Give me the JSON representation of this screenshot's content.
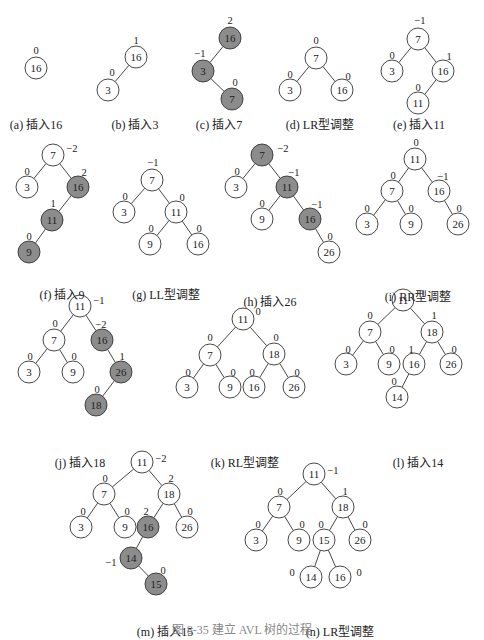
{
  "colors": {
    "highlight_fill": "#8c8c8c",
    "node_fill": "#ffffff",
    "stroke": "#333333",
    "text": "#222222"
  },
  "figure_caption": "图 8-35  建立 AVL 树的过程",
  "panels": [
    {
      "id": "a",
      "caption": "(a) 插入16",
      "cx": 36,
      "cy": 100,
      "nodes": [
        {
          "id": "n16",
          "label": "16",
          "x": 36,
          "y": 68,
          "bf": "0",
          "bfx": 36,
          "bfy": 50,
          "hl": false
        }
      ],
      "edges": []
    },
    {
      "id": "b",
      "caption": "(b) 插入3",
      "cx": 135,
      "cy": 100,
      "nodes": [
        {
          "id": "n16",
          "label": "16",
          "x": 136,
          "y": 57,
          "bf": "1",
          "bfx": 136,
          "bfy": 40,
          "hl": false
        },
        {
          "id": "n3",
          "label": "3",
          "x": 108,
          "y": 90,
          "bf": "0",
          "bfx": 112,
          "bfy": 72,
          "hl": false
        }
      ],
      "edges": [
        [
          "n16",
          "n3"
        ]
      ]
    },
    {
      "id": "c",
      "caption": "(c) 插入7",
      "cx": 219,
      "cy": 100,
      "nodes": [
        {
          "id": "n16",
          "label": "16",
          "x": 230,
          "y": 38,
          "bf": "2",
          "bfx": 230,
          "bfy": 20,
          "hl": true
        },
        {
          "id": "n3",
          "label": "3",
          "x": 203,
          "y": 71,
          "bf": "-1",
          "bfx": 200,
          "bfy": 53,
          "hl": true
        },
        {
          "id": "n7",
          "label": "7",
          "x": 232,
          "y": 99,
          "bf": "0",
          "bfx": 235,
          "bfy": 82,
          "hl": true
        }
      ],
      "edges": [
        [
          "n16",
          "n3"
        ],
        [
          "n3",
          "n7"
        ]
      ]
    },
    {
      "id": "d",
      "caption": "(d) LR型调整",
      "cx": 320,
      "cy": 100,
      "nodes": [
        {
          "id": "n7",
          "label": "7",
          "x": 316,
          "y": 58,
          "bf": "0",
          "bfx": 316,
          "bfy": 40,
          "hl": false
        },
        {
          "id": "n3",
          "label": "3",
          "x": 290,
          "y": 90,
          "bf": "0",
          "bfx": 290,
          "bfy": 74,
          "hl": false
        },
        {
          "id": "n16",
          "label": "16",
          "x": 342,
          "y": 90,
          "bf": "0",
          "bfx": 348,
          "bfy": 76,
          "hl": false
        }
      ],
      "edges": [
        [
          "n7",
          "n3"
        ],
        [
          "n7",
          "n16"
        ]
      ]
    },
    {
      "id": "e",
      "caption": "(e) 插入11",
      "cx": 419,
      "cy": 100,
      "nodes": [
        {
          "id": "n7",
          "label": "7",
          "x": 418,
          "y": 39,
          "bf": "-1",
          "bfx": 420,
          "bfy": 20,
          "hl": false
        },
        {
          "id": "n3",
          "label": "3",
          "x": 392,
          "y": 71,
          "bf": "0",
          "bfx": 392,
          "bfy": 55,
          "hl": false
        },
        {
          "id": "n16",
          "label": "16",
          "x": 443,
          "y": 71,
          "bf": "1",
          "bfx": 449,
          "bfy": 56,
          "hl": false
        },
        {
          "id": "n11",
          "label": "11",
          "x": 418,
          "y": 103,
          "bf": "0",
          "bfx": 418,
          "bfy": 87,
          "hl": false
        }
      ],
      "edges": [
        [
          "n7",
          "n3"
        ],
        [
          "n7",
          "n16"
        ],
        [
          "n16",
          "n11"
        ]
      ]
    },
    {
      "id": "f",
      "caption": "(f) 插入9",
      "cx": 62,
      "cy": 270,
      "nodes": [
        {
          "id": "n7",
          "label": "7",
          "x": 53,
          "y": 155,
          "bf": "-2",
          "bfx": 72,
          "bfy": 148,
          "hl": false
        },
        {
          "id": "n3",
          "label": "3",
          "x": 27,
          "y": 187,
          "bf": "0",
          "bfx": 27,
          "bfy": 171,
          "hl": false
        },
        {
          "id": "n16",
          "label": "16",
          "x": 78,
          "y": 187,
          "bf": "2",
          "bfx": 84,
          "bfy": 172,
          "hl": true
        },
        {
          "id": "n11",
          "label": "11",
          "x": 52,
          "y": 220,
          "bf": "1",
          "bfx": 53,
          "bfy": 203,
          "hl": true
        },
        {
          "id": "n9",
          "label": "9",
          "x": 29,
          "y": 252,
          "bf": "0",
          "bfx": 29,
          "bfy": 236,
          "hl": true
        }
      ],
      "edges": [
        [
          "n7",
          "n3"
        ],
        [
          "n7",
          "n16"
        ],
        [
          "n16",
          "n11"
        ],
        [
          "n11",
          "n9"
        ]
      ]
    },
    {
      "id": "g",
      "caption": "(g) LL型调整",
      "cx": 166,
      "cy": 270,
      "nodes": [
        {
          "id": "n7",
          "label": "7",
          "x": 152,
          "y": 180,
          "bf": "-1",
          "bfx": 153,
          "bfy": 162,
          "hl": false
        },
        {
          "id": "n3",
          "label": "3",
          "x": 124,
          "y": 212,
          "bf": "0",
          "bfx": 125,
          "bfy": 196,
          "hl": false
        },
        {
          "id": "n11",
          "label": "11",
          "x": 176,
          "y": 212,
          "bf": "0",
          "bfx": 182,
          "bfy": 197,
          "hl": false
        },
        {
          "id": "n9",
          "label": "9",
          "x": 150,
          "y": 244,
          "bf": "0",
          "bfx": 151,
          "bfy": 228,
          "hl": false
        },
        {
          "id": "n16",
          "label": "16",
          "x": 198,
          "y": 244,
          "bf": "0",
          "bfx": 199,
          "bfy": 228,
          "hl": false
        }
      ],
      "edges": [
        [
          "n7",
          "n3"
        ],
        [
          "n7",
          "n11"
        ],
        [
          "n11",
          "n9"
        ],
        [
          "n11",
          "n16"
        ]
      ]
    },
    {
      "id": "h",
      "caption": "(h) 插入26",
      "cx": 270,
      "cy": 277,
      "nodes": [
        {
          "id": "n7",
          "label": "7",
          "x": 262,
          "y": 155,
          "bf": "-2",
          "bfx": 283,
          "bfy": 148,
          "hl": true
        },
        {
          "id": "n3",
          "label": "3",
          "x": 236,
          "y": 187,
          "bf": "0",
          "bfx": 237,
          "bfy": 171,
          "hl": false
        },
        {
          "id": "n11",
          "label": "11",
          "x": 287,
          "y": 187,
          "bf": "-1",
          "bfx": 294,
          "bfy": 172,
          "hl": true
        },
        {
          "id": "n9",
          "label": "9",
          "x": 262,
          "y": 219,
          "bf": "0",
          "bfx": 262,
          "bfy": 203,
          "hl": false
        },
        {
          "id": "n16",
          "label": "16",
          "x": 310,
          "y": 219,
          "bf": "-1",
          "bfx": 317,
          "bfy": 204,
          "hl": true
        },
        {
          "id": "n26",
          "label": "26",
          "x": 329,
          "y": 252,
          "bf": "0",
          "bfx": 330,
          "bfy": 236,
          "hl": false
        }
      ],
      "edges": [
        [
          "n7",
          "n3"
        ],
        [
          "n7",
          "n11"
        ],
        [
          "n11",
          "n9"
        ],
        [
          "n11",
          "n16"
        ],
        [
          "n16",
          "n26"
        ]
      ]
    },
    {
      "id": "i",
      "caption": "(i) RR型调整",
      "cx": 418,
      "cy": 272,
      "nodes": [
        {
          "id": "n11",
          "label": "11",
          "x": 415,
          "y": 159,
          "bf": "0",
          "bfx": 416,
          "bfy": 142,
          "hl": false
        },
        {
          "id": "n7",
          "label": "7",
          "x": 392,
          "y": 191,
          "bf": "0",
          "bfx": 393,
          "bfy": 175,
          "hl": false
        },
        {
          "id": "n16",
          "label": "16",
          "x": 439,
          "y": 191,
          "bf": "-1",
          "bfx": 443,
          "bfy": 176,
          "hl": false
        },
        {
          "id": "n3",
          "label": "3",
          "x": 367,
          "y": 224,
          "bf": "0",
          "bfx": 367,
          "bfy": 208,
          "hl": false
        },
        {
          "id": "n9",
          "label": "9",
          "x": 411,
          "y": 224,
          "bf": "0",
          "bfx": 411,
          "bfy": 208,
          "hl": false
        },
        {
          "id": "n26",
          "label": "26",
          "x": 458,
          "y": 224,
          "bf": "0",
          "bfx": 459,
          "bfy": 208,
          "hl": false
        }
      ],
      "edges": [
        [
          "n11",
          "n7"
        ],
        [
          "n11",
          "n16"
        ],
        [
          "n7",
          "n3"
        ],
        [
          "n7",
          "n9"
        ],
        [
          "n16",
          "n26"
        ]
      ]
    },
    {
      "id": "j",
      "caption": "(j) 插入18",
      "cx": 80,
      "cy": 438,
      "nodes": [
        {
          "id": "n11",
          "label": "11",
          "x": 80,
          "y": 306,
          "bf": "-1",
          "bfx": 99,
          "bfy": 300,
          "hl": false
        },
        {
          "id": "n7",
          "label": "7",
          "x": 54,
          "y": 340,
          "bf": "0",
          "bfx": 55,
          "bfy": 323,
          "hl": false
        },
        {
          "id": "n16",
          "label": "16",
          "x": 102,
          "y": 340,
          "bf": "-2",
          "bfx": 101,
          "bfy": 324,
          "hl": true
        },
        {
          "id": "n3",
          "label": "3",
          "x": 29,
          "y": 372,
          "bf": "0",
          "bfx": 30,
          "bfy": 356,
          "hl": false
        },
        {
          "id": "n9",
          "label": "9",
          "x": 73,
          "y": 372,
          "bf": "0",
          "bfx": 74,
          "bfy": 356,
          "hl": false
        },
        {
          "id": "n26",
          "label": "26",
          "x": 121,
          "y": 372,
          "bf": "1",
          "bfx": 122,
          "bfy": 356,
          "hl": true
        },
        {
          "id": "n18",
          "label": "18",
          "x": 96,
          "y": 405,
          "bf": "0",
          "bfx": 97,
          "bfy": 389,
          "hl": true
        }
      ],
      "edges": [
        [
          "n11",
          "n7"
        ],
        [
          "n11",
          "n16"
        ],
        [
          "n7",
          "n3"
        ],
        [
          "n7",
          "n9"
        ],
        [
          "n16",
          "n26"
        ],
        [
          "n26",
          "n18"
        ]
      ]
    },
    {
      "id": "k",
      "caption": "(k) RL型调整",
      "cx": 245,
      "cy": 438,
      "nodes": [
        {
          "id": "n11",
          "label": "11",
          "x": 243,
          "y": 319,
          "bf": "0",
          "bfx": 258,
          "bfy": 311,
          "hl": false
        },
        {
          "id": "n7",
          "label": "7",
          "x": 210,
          "y": 355,
          "bf": "0",
          "bfx": 210,
          "bfy": 337,
          "hl": false
        },
        {
          "id": "n18",
          "label": "18",
          "x": 274,
          "y": 354,
          "bf": "0",
          "bfx": 276,
          "bfy": 337,
          "hl": false
        },
        {
          "id": "n3",
          "label": "3",
          "x": 187,
          "y": 387,
          "bf": "0",
          "bfx": 188,
          "bfy": 372,
          "hl": false
        },
        {
          "id": "n9",
          "label": "9",
          "x": 230,
          "y": 387,
          "bf": "0",
          "bfx": 233,
          "bfy": 372,
          "hl": false
        },
        {
          "id": "n16",
          "label": "16",
          "x": 254,
          "y": 387,
          "bf": "0",
          "bfx": 252,
          "bfy": 372,
          "hl": false
        },
        {
          "id": "n26",
          "label": "26",
          "x": 294,
          "y": 387,
          "bf": "0",
          "bfx": 297,
          "bfy": 372,
          "hl": false
        }
      ],
      "edges": [
        [
          "n11",
          "n7"
        ],
        [
          "n11",
          "n18"
        ],
        [
          "n7",
          "n3"
        ],
        [
          "n7",
          "n9"
        ],
        [
          "n18",
          "n16"
        ],
        [
          "n18",
          "n26"
        ]
      ]
    },
    {
      "id": "l",
      "caption": "(l) 插入14",
      "cx": 418,
      "cy": 438,
      "nodes": [
        {
          "id": "n11",
          "label": "11",
          "x": 403,
          "y": 300,
          "bf": "-1",
          "bfx": 420,
          "bfy": 293,
          "hl": false
        },
        {
          "id": "n7",
          "label": "7",
          "x": 370,
          "y": 332,
          "bf": "0",
          "bfx": 370,
          "bfy": 315,
          "hl": false
        },
        {
          "id": "n18",
          "label": "18",
          "x": 432,
          "y": 332,
          "bf": "1",
          "bfx": 434,
          "bfy": 315,
          "hl": false
        },
        {
          "id": "n3",
          "label": "3",
          "x": 346,
          "y": 364,
          "bf": "0",
          "bfx": 348,
          "bfy": 349,
          "hl": false
        },
        {
          "id": "n9",
          "label": "9",
          "x": 389,
          "y": 364,
          "bf": "0",
          "bfx": 392,
          "bfy": 349,
          "hl": false
        },
        {
          "id": "n16",
          "label": "16",
          "x": 414,
          "y": 364,
          "bf": "1",
          "bfx": 411,
          "bfy": 349,
          "hl": false
        },
        {
          "id": "n26",
          "label": "26",
          "x": 451,
          "y": 364,
          "bf": "0",
          "bfx": 454,
          "bfy": 349,
          "hl": false
        },
        {
          "id": "n14",
          "label": "14",
          "x": 397,
          "y": 397,
          "bf": "0",
          "bfx": 394,
          "bfy": 381,
          "hl": false
        }
      ],
      "edges": [
        [
          "n11",
          "n7"
        ],
        [
          "n11",
          "n18"
        ],
        [
          "n7",
          "n3"
        ],
        [
          "n7",
          "n9"
        ],
        [
          "n18",
          "n16"
        ],
        [
          "n18",
          "n26"
        ],
        [
          "n16",
          "n14"
        ]
      ]
    },
    {
      "id": "m",
      "caption": "(m) 插入15",
      "cx": 165,
      "cy": 607,
      "nodes": [
        {
          "id": "n11",
          "label": "11",
          "x": 142,
          "y": 462,
          "bf": "-2",
          "bfx": 161,
          "bfy": 458,
          "hl": false
        },
        {
          "id": "n7",
          "label": "7",
          "x": 104,
          "y": 494,
          "bf": "0",
          "bfx": 105,
          "bfy": 478,
          "hl": false
        },
        {
          "id": "n18",
          "label": "18",
          "x": 169,
          "y": 494,
          "bf": "2",
          "bfx": 171,
          "bfy": 478,
          "hl": false
        },
        {
          "id": "n3",
          "label": "3",
          "x": 81,
          "y": 527,
          "bf": "0",
          "bfx": 83,
          "bfy": 511,
          "hl": false
        },
        {
          "id": "n9",
          "label": "9",
          "x": 125,
          "y": 527,
          "bf": "0",
          "bfx": 127,
          "bfy": 511,
          "hl": false
        },
        {
          "id": "n16",
          "label": "16",
          "x": 148,
          "y": 527,
          "bf": "2",
          "bfx": 146,
          "bfy": 511,
          "hl": true
        },
        {
          "id": "n26",
          "label": "26",
          "x": 187,
          "y": 527,
          "bf": "0",
          "bfx": 190,
          "bfy": 511,
          "hl": false
        },
        {
          "id": "n14",
          "label": "14",
          "x": 131,
          "y": 558,
          "bf": "-1",
          "bfx": 111,
          "bfy": 562,
          "hl": true
        },
        {
          "id": "n15",
          "label": "15",
          "x": 156,
          "y": 584,
          "bf": "0",
          "bfx": 163,
          "bfy": 570,
          "hl": true
        }
      ],
      "edges": [
        [
          "n11",
          "n7"
        ],
        [
          "n11",
          "n18"
        ],
        [
          "n7",
          "n3"
        ],
        [
          "n7",
          "n9"
        ],
        [
          "n18",
          "n16"
        ],
        [
          "n18",
          "n26"
        ],
        [
          "n16",
          "n14"
        ],
        [
          "n14",
          "n15"
        ]
      ]
    },
    {
      "id": "n",
      "caption": "(n) LR型调整",
      "cx": 340,
      "cy": 607,
      "nodes": [
        {
          "id": "n11",
          "label": "11",
          "x": 314,
          "y": 474,
          "bf": "-1",
          "bfx": 333,
          "bfy": 470,
          "hl": false
        },
        {
          "id": "n7",
          "label": "7",
          "x": 279,
          "y": 507,
          "bf": "0",
          "bfx": 280,
          "bfy": 491,
          "hl": false
        },
        {
          "id": "n18",
          "label": "18",
          "x": 343,
          "y": 507,
          "bf": "1",
          "bfx": 345,
          "bfy": 491,
          "hl": false
        },
        {
          "id": "n3",
          "label": "3",
          "x": 256,
          "y": 540,
          "bf": "0",
          "bfx": 258,
          "bfy": 524,
          "hl": false
        },
        {
          "id": "n9",
          "label": "9",
          "x": 299,
          "y": 540,
          "bf": "0",
          "bfx": 302,
          "bfy": 524,
          "hl": false
        },
        {
          "id": "n15",
          "label": "15",
          "x": 324,
          "y": 540,
          "bf": "0",
          "bfx": 321,
          "bfy": 524,
          "hl": false
        },
        {
          "id": "n26",
          "label": "26",
          "x": 360,
          "y": 540,
          "bf": "0",
          "bfx": 365,
          "bfy": 524,
          "hl": false
        },
        {
          "id": "n14",
          "label": "14",
          "x": 311,
          "y": 577,
          "bf": "0",
          "bfx": 292,
          "bfy": 572,
          "hl": false
        },
        {
          "id": "n16",
          "label": "16",
          "x": 340,
          "y": 577,
          "bf": "0",
          "bfx": 359,
          "bfy": 572,
          "hl": false
        }
      ],
      "edges": [
        [
          "n11",
          "n7"
        ],
        [
          "n11",
          "n18"
        ],
        [
          "n7",
          "n3"
        ],
        [
          "n7",
          "n9"
        ],
        [
          "n18",
          "n15"
        ],
        [
          "n18",
          "n26"
        ],
        [
          "n15",
          "n14"
        ],
        [
          "n15",
          "n16"
        ]
      ]
    }
  ]
}
